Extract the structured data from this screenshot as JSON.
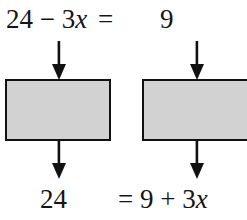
{
  "diagram": {
    "type": "equation-transformation-flowchart",
    "colors": {
      "box_fill": "#d2d2d2",
      "box_border": "#111111",
      "text": "#141414",
      "background": "#ffffff",
      "arrow": "#111111"
    },
    "top_row": {
      "left_expression": "24 − 3",
      "left_variable": "x",
      "equals": "=",
      "right_expression": "9"
    },
    "bottom_row": {
      "left_expression": "24",
      "right_expression_prefix": "= 9 + 3",
      "right_variable": "x"
    },
    "boxes": [
      {
        "id": "left-operation-box",
        "label": ""
      },
      {
        "id": "right-operation-box",
        "label": ""
      }
    ],
    "arrows": [
      {
        "id": "arrow-into-left-box",
        "direction": "down"
      },
      {
        "id": "arrow-out-of-left-box",
        "direction": "down"
      },
      {
        "id": "arrow-into-right-box",
        "direction": "down"
      },
      {
        "id": "arrow-out-of-right-box",
        "direction": "down"
      }
    ]
  }
}
